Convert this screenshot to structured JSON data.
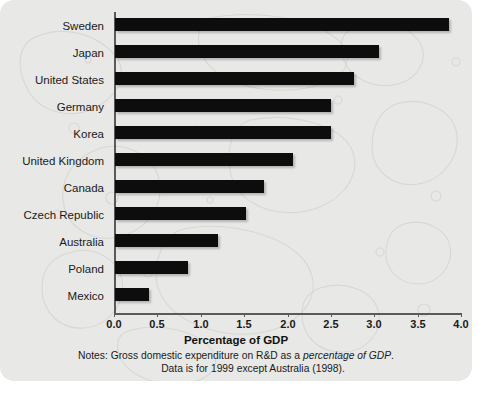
{
  "chart_data": {
    "type": "bar",
    "orientation": "horizontal",
    "title": "",
    "xlabel": "Percentage of GDP",
    "ylabel": "",
    "xlim": [
      0,
      4
    ],
    "grid": false,
    "legend": null,
    "categories": [
      "Sweden",
      "Japan",
      "United States",
      "Germany",
      "Korea",
      "United Kingdom",
      "Canada",
      "Czech Republic",
      "Australia",
      "Poland",
      "Mexico"
    ],
    "values": [
      3.85,
      3.04,
      2.75,
      2.49,
      2.49,
      2.05,
      1.72,
      1.51,
      1.19,
      0.84,
      0.39
    ],
    "xticks": [
      "0.0",
      "0.5",
      "1.0",
      "1.5",
      "2.0",
      "2.5",
      "3.0",
      "3.5",
      "4.0"
    ],
    "xtick_values": [
      0,
      0.5,
      1,
      1.5,
      2,
      2.5,
      3,
      3.5,
      4
    ],
    "bar_color": "#0d0d0d",
    "background_color": "#e8e8e6",
    "notes": {
      "line1_prefix": "Notes: Gross domestic expenditure on R&D as a ",
      "line1_italic": "percentage of GDP",
      "line1_suffix": ".",
      "line2": "Data is for 1999 except Australia (1998)."
    }
  }
}
